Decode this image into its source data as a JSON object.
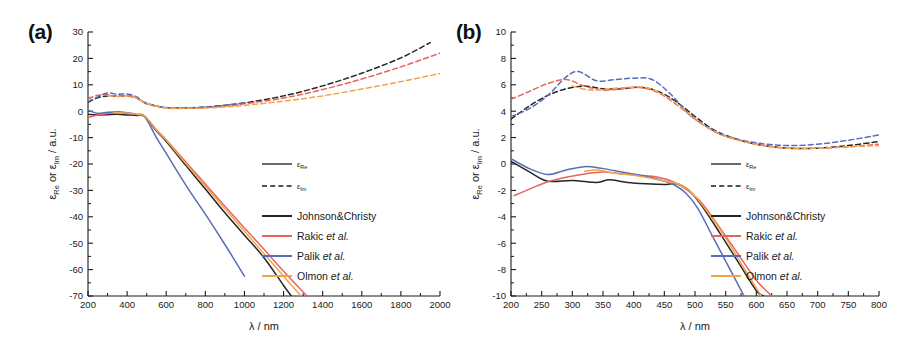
{
  "figure": {
    "panels": [
      {
        "id": "a",
        "label": "(a)",
        "xlabel": "λ / nm",
        "ylabel": "εRe or εIm / a.u.",
        "xticks": [
          200,
          400,
          600,
          800,
          1000,
          1200,
          1400,
          1600,
          1800,
          2000
        ],
        "yticks": [
          30,
          20,
          10,
          0,
          -10,
          -20,
          -30,
          -40,
          -50,
          -60,
          -70
        ],
        "xlim": [
          200,
          2000
        ],
        "ylim": [
          -70,
          30
        ]
      },
      {
        "id": "b",
        "label": "(b)",
        "xlabel": "λ / nm",
        "ylabel": "εRe or εIm / a.u.",
        "xticks": [
          200,
          250,
          300,
          350,
          400,
          450,
          500,
          550,
          600,
          650,
          700,
          750,
          800
        ],
        "yticks": [
          10,
          8,
          6,
          4,
          2,
          0,
          -2,
          -4,
          -6,
          -8,
          -10
        ],
        "xlim": [
          200,
          800
        ],
        "ylim": [
          -10,
          10
        ]
      }
    ],
    "legend": {
      "linestyle_entries": [
        {
          "symbol": "ε",
          "sub": "Re",
          "style": "solid"
        },
        {
          "symbol": "ε",
          "sub": "Im",
          "style": "dashed"
        }
      ],
      "series_entries": [
        {
          "label": "Johnson&Christy",
          "italic": "",
          "color": "#262626"
        },
        {
          "label": "Rakic ",
          "italic": "et al.",
          "color": "#e8645e"
        },
        {
          "label": "Palik ",
          "italic": "et al.",
          "color": "#5a6cb8"
        },
        {
          "label": "Olmon ",
          "italic": "et al.",
          "color": "#f3a44a"
        }
      ]
    }
  },
  "chart_data": [
    {
      "type": "line",
      "panel": "a",
      "title": "(a)",
      "xlabel": "λ / nm",
      "ylabel": "εRe or εIm / a.u.",
      "xlim": [
        200,
        2000
      ],
      "ylim": [
        -70,
        30
      ],
      "grid": false,
      "legend_position": "right-middle",
      "series": [
        {
          "name": "Johnson&Christy εRe",
          "color": "#262626",
          "linestyle": "solid",
          "x": [
            200,
            250,
            300,
            350,
            400,
            450,
            490,
            550,
            600,
            700,
            800,
            900,
            1000,
            1100,
            1200,
            1240
          ],
          "y": [
            -1.2,
            -1.4,
            -1.3,
            -1.2,
            -1.4,
            -1.6,
            -2.0,
            -7.5,
            -11.5,
            -20.5,
            -29.5,
            -38.5,
            -47.0,
            -55.5,
            -66.0,
            -70.0
          ]
        },
        {
          "name": "Rakic εRe",
          "color": "#e8645e",
          "linestyle": "solid",
          "x": [
            200,
            250,
            300,
            350,
            400,
            450,
            490,
            550,
            600,
            700,
            800,
            900,
            1000,
            1100,
            1200,
            1320
          ],
          "y": [
            -2.4,
            -1.4,
            -0.9,
            -0.6,
            -0.8,
            -1.3,
            -1.9,
            -7.0,
            -10.8,
            -19.2,
            -27.6,
            -36.0,
            -44.2,
            -52.3,
            -60.6,
            -70.0
          ]
        },
        {
          "name": "Palik εRe",
          "color": "#5a6cb8",
          "linestyle": "solid",
          "x": [
            200,
            250,
            300,
            350,
            400,
            450,
            490,
            550,
            600,
            700,
            800,
            900,
            1000
          ],
          "y": [
            0.4,
            -0.8,
            -0.4,
            -0.2,
            -0.6,
            -1.2,
            -2.0,
            -10.0,
            -16.0,
            -28.0,
            -39.0,
            -50.5,
            -62.5
          ]
        },
        {
          "name": "Olmon εRe",
          "color": "#f3a44a",
          "linestyle": "solid",
          "x": [
            330,
            400,
            450,
            490,
            550,
            600,
            700,
            800,
            900,
            1000,
            1100,
            1200,
            1290
          ],
          "y": [
            -0.4,
            -0.7,
            -1.2,
            -1.8,
            -7.2,
            -11.0,
            -19.8,
            -28.4,
            -37.0,
            -45.5,
            -54.0,
            -62.5,
            -70.0
          ]
        },
        {
          "name": "Johnson&Christy εIm",
          "color": "#262626",
          "linestyle": "dashed",
          "x": [
            200,
            250,
            300,
            350,
            400,
            450,
            500,
            600,
            700,
            800,
            900,
            1000,
            1200,
            1400,
            1600,
            1800,
            1950
          ],
          "y": [
            3.4,
            5.1,
            5.8,
            5.7,
            5.8,
            5.0,
            2.8,
            1.3,
            1.2,
            1.5,
            2.2,
            3.1,
            5.8,
            9.6,
            14.4,
            20.2,
            26.0
          ]
        },
        {
          "name": "Rakic εIm",
          "color": "#e8645e",
          "linestyle": "dashed",
          "x": [
            200,
            250,
            300,
            350,
            400,
            450,
            500,
            600,
            700,
            800,
            900,
            1000,
            1200,
            1400,
            1600,
            1800,
            2000
          ],
          "y": [
            4.9,
            6.0,
            6.2,
            5.7,
            5.8,
            5.0,
            2.9,
            1.3,
            1.2,
            1.4,
            2.0,
            2.8,
            5.0,
            8.2,
            12.2,
            16.8,
            22.0
          ]
        },
        {
          "name": "Palik εIm",
          "color": "#5a6cb8",
          "linestyle": "dashed",
          "x": [
            200,
            250,
            300,
            350,
            400,
            450,
            500,
            600,
            700,
            800,
            900,
            1000
          ],
          "y": [
            3.6,
            5.4,
            6.9,
            6.4,
            6.5,
            5.4,
            3.0,
            1.4,
            1.3,
            1.6,
            2.3,
            3.2
          ]
        },
        {
          "name": "Olmon εIm",
          "color": "#f3a44a",
          "linestyle": "dashed",
          "x": [
            300,
            350,
            400,
            450,
            500,
            600,
            700,
            800,
            900,
            1000,
            1200,
            1400,
            1600,
            1800,
            2000
          ],
          "y": [
            5.9,
            5.6,
            5.8,
            5.0,
            2.9,
            1.2,
            1.1,
            1.2,
            1.6,
            2.2,
            3.8,
            5.8,
            8.4,
            11.2,
            14.3
          ]
        }
      ]
    },
    {
      "type": "line",
      "panel": "b",
      "title": "(b)",
      "xlabel": "λ / nm",
      "ylabel": "εRe or εIm / a.u.",
      "xlim": [
        200,
        800
      ],
      "ylim": [
        -10,
        10
      ],
      "grid": false,
      "legend_position": "right-middle",
      "series": [
        {
          "name": "Johnson&Christy εRe",
          "color": "#262626",
          "linestyle": "solid",
          "x": [
            200,
            230,
            260,
            300,
            340,
            360,
            390,
            420,
            450,
            470,
            490,
            510,
            540,
            570,
            600,
            612
          ],
          "y": [
            0.2,
            -0.6,
            -1.3,
            -1.25,
            -1.4,
            -1.2,
            -1.4,
            -1.5,
            -1.55,
            -1.5,
            -2.0,
            -3.1,
            -5.2,
            -7.4,
            -9.6,
            -10.0
          ]
        },
        {
          "name": "Rakic εRe",
          "color": "#e8645e",
          "linestyle": "solid",
          "x": [
            205,
            230,
            260,
            290,
            320,
            350,
            380,
            410,
            440,
            465,
            485,
            510,
            540,
            570,
            600,
            625
          ],
          "y": [
            -2.4,
            -1.9,
            -1.35,
            -1.0,
            -0.75,
            -0.6,
            -0.75,
            -0.85,
            -1.0,
            -1.35,
            -1.9,
            -2.9,
            -4.8,
            -6.8,
            -8.8,
            -10.0
          ]
        },
        {
          "name": "Palik εRe",
          "color": "#5a6cb8",
          "linestyle": "solid",
          "x": [
            200,
            230,
            260,
            290,
            320,
            350,
            380,
            410,
            440,
            465,
            485,
            505,
            530,
            555,
            580
          ],
          "y": [
            0.4,
            -0.35,
            -0.8,
            -0.45,
            -0.2,
            -0.35,
            -0.6,
            -0.85,
            -1.15,
            -1.55,
            -2.2,
            -3.4,
            -5.6,
            -7.8,
            -10.0
          ]
        },
        {
          "name": "Olmon εRe",
          "color": "#f3a44a",
          "linestyle": "solid",
          "x": [
            320,
            340,
            370,
            400,
            430,
            455,
            475,
            495,
            520,
            550,
            580,
            608
          ],
          "y": [
            -0.55,
            -0.45,
            -0.7,
            -0.85,
            -1.1,
            -1.35,
            -1.55,
            -2.2,
            -3.6,
            -5.6,
            -7.9,
            -10.0
          ]
        },
        {
          "name": "Johnson&Christy εIm",
          "color": "#262626",
          "linestyle": "dashed",
          "x": [
            200,
            230,
            260,
            290,
            320,
            350,
            380,
            410,
            440,
            470,
            500,
            530,
            560,
            600,
            650,
            700,
            750,
            800
          ],
          "y": [
            3.4,
            4.4,
            5.2,
            5.7,
            5.9,
            5.7,
            5.7,
            5.8,
            5.5,
            4.7,
            3.6,
            2.6,
            2.0,
            1.5,
            1.2,
            1.2,
            1.4,
            1.7
          ]
        },
        {
          "name": "Rakic εIm",
          "color": "#e8645e",
          "linestyle": "dashed",
          "x": [
            200,
            230,
            260,
            290,
            320,
            350,
            380,
            410,
            440,
            470,
            500,
            530,
            560,
            600,
            650,
            700,
            750,
            800
          ],
          "y": [
            4.9,
            5.5,
            6.1,
            6.4,
            5.9,
            5.6,
            5.7,
            5.8,
            5.4,
            4.5,
            3.4,
            2.5,
            2.0,
            1.5,
            1.2,
            1.2,
            1.3,
            1.5
          ]
        },
        {
          "name": "Palik εIm",
          "color": "#5a6cb8",
          "linestyle": "dashed",
          "x": [
            200,
            230,
            260,
            290,
            310,
            340,
            370,
            400,
            430,
            460,
            490,
            520,
            550,
            600,
            650,
            700,
            750,
            800
          ],
          "y": [
            3.6,
            4.2,
            5.2,
            6.6,
            7.0,
            6.3,
            6.4,
            6.5,
            6.4,
            5.3,
            3.8,
            2.8,
            2.1,
            1.6,
            1.4,
            1.5,
            1.8,
            2.2
          ]
        },
        {
          "name": "Olmon εIm",
          "color": "#f3a44a",
          "linestyle": "dashed",
          "x": [
            300,
            330,
            360,
            390,
            420,
            450,
            480,
            510,
            540,
            570,
            610,
            650,
            700,
            750,
            800
          ],
          "y": [
            5.9,
            5.6,
            5.7,
            5.8,
            5.8,
            5.2,
            4.2,
            3.1,
            2.3,
            1.8,
            1.4,
            1.2,
            1.2,
            1.3,
            1.4
          ]
        }
      ]
    }
  ]
}
